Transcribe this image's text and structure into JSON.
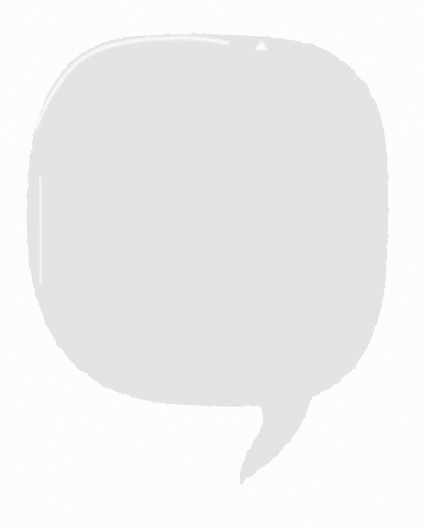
{
  "canvas": {
    "width": 424,
    "height": 528,
    "background_color": "#ffffff",
    "title": "Speech Bubble"
  },
  "artwork": {
    "name": "speech-bubble",
    "description": "Hand-drawn rounded speech bubble with a hooked tail",
    "fill_color": "#e5e6e6",
    "fill_color_soft": "#e8e9e9",
    "edge_color": "#ececec",
    "highlight_color": "#ffffff",
    "texture": "paper-grain",
    "body": {
      "name": "bubble-body",
      "bounds": {
        "x": 27,
        "y": 35,
        "width": 361,
        "height": 372
      },
      "corner_radius": 118
    },
    "tail": {
      "name": "bubble-tail",
      "tip": {
        "x": 240,
        "y": 484
      },
      "attach_left": {
        "x": 238,
        "y": 399
      },
      "attach_right": {
        "x": 312,
        "y": 392
      }
    },
    "highlight_stroke": {
      "name": "top-left-highlight-stroke",
      "start": {
        "x": 36,
        "y": 128
      },
      "end": {
        "x": 228,
        "y": 43
      },
      "width": 3
    },
    "notch": {
      "name": "top-edge-notch",
      "x": 255,
      "y": 40,
      "width": 13,
      "height": 10
    },
    "slit": {
      "name": "left-edge-slit",
      "x": 39,
      "y": 176,
      "width": 3,
      "height": 108
    }
  },
  "paths": {
    "body_d": "M 128 37 C 160 34 196 33 232 35 C 260 36 286 38 306 43 C 330 49 352 64 367 86 C 380 106 386 131 387 160 C 389 196 388 240 386 275 C 383 310 374 341 356 365 C 338 388 312 400 280 404 C 246 408 200 407 163 403 C 126 399 95 386 72 362 C 49 338 35 304 30 266 C 25 228 26 186 31 150 C 36 114 49 84 70 63 C 86 47 106 40 128 37 Z",
    "tail_d": "M 238 398 C 252 401 272 401 290 398 C 302 396 308 394 312 392 C 311 402 306 416 299 428 C 290 443 276 457 262 468 C 252 476 245 481 240 484 C 239 478 240 470 243 462 C 247 452 253 444 257 436 C 262 427 264 418 262 410 C 260 404 252 400 238 398 Z",
    "highlight_d": "M 36 128 C 45 104 58 80 78 62 C 100 43 140 38 180 38 C 198 38 214 40 228 43",
    "notch_d": "M 255 50 L 261 40 L 268 50 Z",
    "slit_d": "M 40 176 C 41 200 42 240 41 284"
  }
}
